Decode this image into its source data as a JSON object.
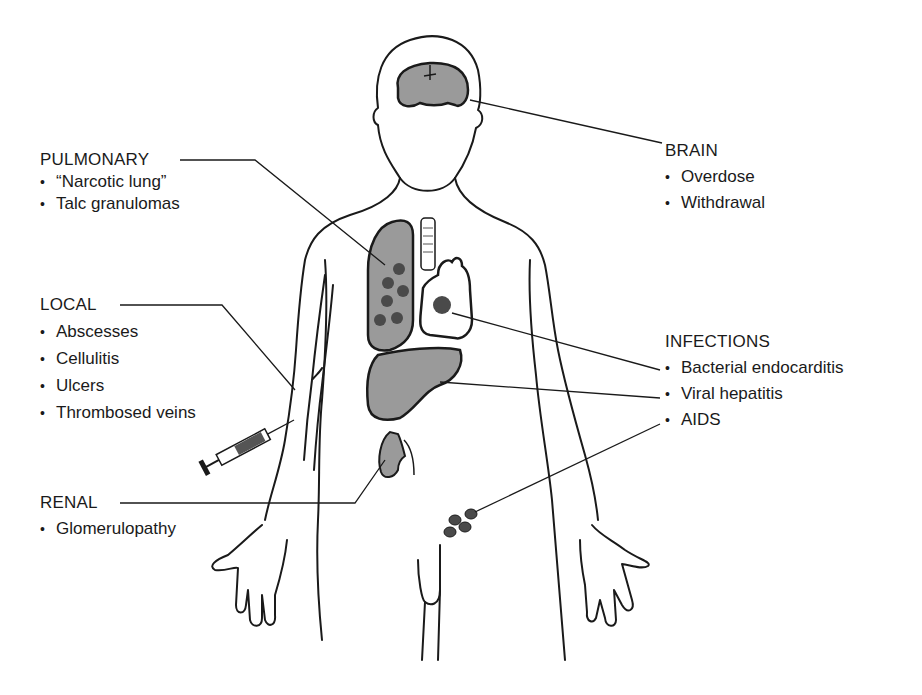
{
  "figure": {
    "colors": {
      "line": "#1a1a1a",
      "organ_fill": "#9a9a9a",
      "lesion": "#4a4a4a",
      "background": "#ffffff"
    }
  },
  "groups": {
    "pulmonary": {
      "heading": "PULMONARY",
      "items": [
        "“Narcotic lung”",
        "Talc granulomas"
      ]
    },
    "local": {
      "heading": "LOCAL",
      "items": [
        "Abscesses",
        "Cellulitis",
        "Ulcers",
        "Thrombosed veins"
      ]
    },
    "renal": {
      "heading": "RENAL",
      "items": [
        "Glomerulopathy"
      ]
    },
    "brain": {
      "heading": "BRAIN",
      "items": [
        "Overdose",
        "Withdrawal"
      ]
    },
    "infections": {
      "heading": "INFECTIONS",
      "items": [
        "Bacterial endocarditis",
        "Viral hepatitis",
        "AIDS"
      ]
    }
  }
}
